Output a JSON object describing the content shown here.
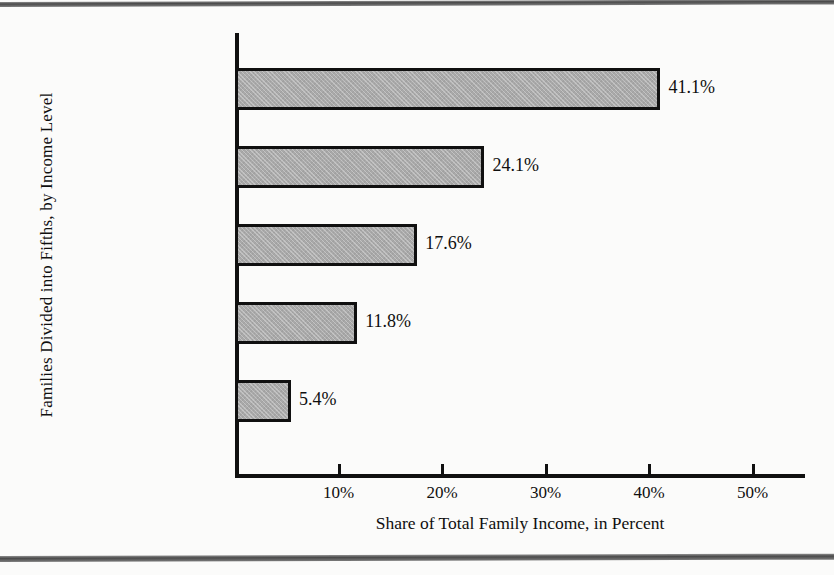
{
  "chart_data": {
    "type": "bar",
    "orientation": "horizontal",
    "title": "",
    "xlabel": "Share of Total Family Income, in Percent",
    "ylabel": "Families Divided into Fifths, by Income Level",
    "xlim": [
      0,
      55
    ],
    "grid": false,
    "legend": "none",
    "xticks": [
      10,
      20,
      30,
      40,
      50
    ],
    "xticklabels": [
      "10%",
      "20%",
      "30%",
      "40%",
      "50%"
    ],
    "categories": [
      "Top fifth ($23,924 and over)",
      "Second fifth ($17,301–23,923)",
      "Third fifth ($12,401–17,300)",
      "Fourth fifth ($7,442–12,400)",
      "Bottom fifth (Less than $7,442)"
    ],
    "values": [
      41.1,
      24.1,
      17.6,
      11.8,
      5.4
    ],
    "value_labels": [
      "41.1%",
      "24.1%",
      "17.6%",
      "11.8%",
      "5.4%"
    ],
    "bar_fill_color": "#a9a9a9",
    "bar_border_color": "#101010"
  },
  "bars": [
    {
      "label_line1": "Top fifth",
      "label_line2": "($23,924 and over)",
      "value": 41.1,
      "value_label": "41.1%"
    },
    {
      "label_line1": "Second fifth",
      "label_line2": "($17,301–23,923)",
      "value": 24.1,
      "value_label": "24.1%"
    },
    {
      "label_line1": "Third fifth",
      "label_line2": "($12,401–17,300)",
      "value": 17.6,
      "value_label": "17.6%"
    },
    {
      "label_line1": "Fourth fifth",
      "label_line2": "($7,442–12,400)",
      "value": 11.8,
      "value_label": "11.8%"
    },
    {
      "label_line1": "Bottom fifth",
      "label_line2": "(Less than $7,442)",
      "value": 5.4,
      "value_label": "5.4%"
    }
  ],
  "axes": {
    "x_title": "Share of Total Family Income, in Percent",
    "y_title": "Families Divided into Fifths, by Income Level",
    "x_ticks": [
      {
        "value": 10,
        "label": "10%"
      },
      {
        "value": 20,
        "label": "20%"
      },
      {
        "value": 30,
        "label": "30%"
      },
      {
        "value": 40,
        "label": "40%"
      },
      {
        "value": 50,
        "label": "50%"
      }
    ]
  }
}
